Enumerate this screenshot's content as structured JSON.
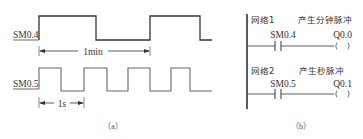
{
  "figure_a": {
    "caption": "（a）",
    "signals": [
      {
        "name": "SM0.4",
        "period_label": "1min"
      },
      {
        "name": "SM0.5",
        "period_label": "1s"
      }
    ]
  },
  "figure_b": {
    "caption": "（b）",
    "networks": [
      {
        "title": "网络1",
        "comment": "产生分钟脉冲",
        "contact": "SM0.4",
        "coil": "Q0.0"
      },
      {
        "title": "网络2",
        "comment": "产生秒脉冲",
        "contact": "SM0.5",
        "coil": "Q0.1"
      }
    ]
  }
}
